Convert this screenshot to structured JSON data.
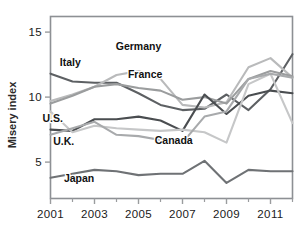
{
  "chart_data": {
    "type": "line",
    "title": "",
    "xlabel": "",
    "ylabel": "Misery index",
    "x": [
      2001,
      2002,
      2003,
      2004,
      2005,
      2006,
      2007,
      2008,
      2009,
      2010,
      2011,
      2012
    ],
    "xlim": [
      2001,
      2012
    ],
    "ylim": [
      2.2,
      16.2
    ],
    "ytick_values": [
      5,
      10,
      15
    ],
    "ytick_labels": [
      "5",
      "10",
      "15"
    ],
    "xtick_values": [
      2001,
      2003,
      2005,
      2007,
      2009,
      2011
    ],
    "xtick_labels": [
      "2001",
      "2003",
      "2005",
      "2007",
      "2009",
      "2011"
    ],
    "xminor_values": [
      2002,
      2004,
      2006,
      2008,
      2010,
      2012
    ],
    "grid": false,
    "legend": "inline-labels",
    "series": [
      {
        "name": "Italy",
        "color": "#5d6063",
        "label": "Italy",
        "label_x": 2001.9,
        "label_y": 12.4,
        "values": [
          11.8,
          11.2,
          11.1,
          11.1,
          10.3,
          9.4,
          9.0,
          9.1,
          10.2,
          9.0,
          10.6,
          13.3
        ]
      },
      {
        "name": "Germany",
        "color": "#b9babb",
        "label": "Germany",
        "label_x": 2005.0,
        "label_y": 13.6,
        "values": [
          9.7,
          10.2,
          10.8,
          11.7,
          12.0,
          11.4,
          9.4,
          9.2,
          9.6,
          12.3,
          13.0,
          11.5
        ]
      },
      {
        "name": "France",
        "color": "#9b9d9e",
        "label": "France",
        "label_x": 2005.3,
        "label_y": 11.5,
        "values": [
          9.5,
          10.1,
          10.8,
          11.0,
          10.7,
          10.5,
          9.8,
          10.0,
          9.5,
          11.4,
          12.0,
          11.6
        ]
      },
      {
        "name": "U.S.",
        "color": "#4a4d50",
        "label": "U.S.",
        "label_x": 2001.1,
        "label_y": 8.1,
        "values": [
          7.5,
          7.4,
          8.3,
          8.3,
          8.5,
          8.2,
          7.4,
          10.2,
          8.7,
          10.1,
          10.5,
          10.3
        ]
      },
      {
        "name": "U.K.",
        "color": "#c6c7c8",
        "label": "U.K.",
        "label_x": 2001.6,
        "label_y": 6.3,
        "values": [
          8.9,
          7.3,
          7.8,
          7.6,
          7.5,
          7.4,
          7.5,
          7.3,
          6.5,
          11.0,
          11.8,
          8.0
        ]
      },
      {
        "name": "Canada",
        "color": "#a8aaac",
        "label": "Canada",
        "label_x": 2006.6,
        "label_y": 6.4,
        "values": [
          7.1,
          7.6,
          8.1,
          7.1,
          7.0,
          6.7,
          6.5,
          8.5,
          8.9,
          11.4,
          11.8,
          11.5
        ]
      },
      {
        "name": "Japan",
        "color": "#6f7275",
        "label": "Japan",
        "label_x": 2002.3,
        "label_y": 3.5,
        "values": [
          3.8,
          4.1,
          4.4,
          4.3,
          4.0,
          4.1,
          4.1,
          5.1,
          3.4,
          4.4,
          4.3,
          4.3
        ]
      }
    ]
  },
  "axes": {
    "y_axis_title": "Misery index",
    "frame_color": "#8d9094",
    "tick_color": "#9a9c9e"
  }
}
